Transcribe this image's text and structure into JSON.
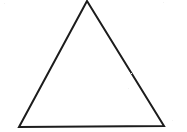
{
  "figure": {
    "kind": "geometry-diagram",
    "caption": "",
    "background_color": "#ffffff",
    "stroke_color": "#1c1c1c",
    "stroke_width": 2,
    "fill": "none",
    "canvas": {
      "width": 187,
      "height": 132
    },
    "shape": {
      "name": "triangle",
      "type": "polygon",
      "closed": true,
      "sides": 3,
      "vertices": [
        {
          "name": "apex",
          "x": 87,
          "y": 1
        },
        {
          "name": "bottom-right",
          "x": 164,
          "y": 126
        },
        {
          "name": "bottom-left",
          "x": 19,
          "y": 127
        }
      ],
      "points_attr": "87,1 164,126 19,127",
      "edges": [
        {
          "name": "left-side",
          "from": "apex",
          "to": "bottom-left"
        },
        {
          "name": "right-side",
          "from": "apex",
          "to": "bottom-right"
        },
        {
          "name": "base",
          "from": "bottom-left",
          "to": "bottom-right"
        }
      ],
      "base_width": 145,
      "height": 126
    },
    "labels": [],
    "annotations": []
  },
  "speckles": [
    {
      "x": 129,
      "y": 72
    },
    {
      "x": 131,
      "y": 73
    },
    {
      "x": 128,
      "y": 88
    },
    {
      "x": 4,
      "y": 3
    },
    {
      "x": 163,
      "y": 2
    },
    {
      "x": 172,
      "y": 120
    }
  ]
}
